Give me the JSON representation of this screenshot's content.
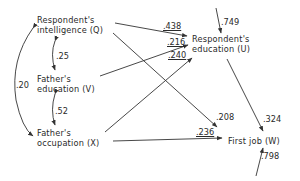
{
  "diagram": {
    "type": "path-diagram",
    "nodes": [
      {
        "id": "Q",
        "line1": "Respondent's",
        "line2": "intelligence (Q)"
      },
      {
        "id": "V",
        "line1": "Father's",
        "line2": "education (V)"
      },
      {
        "id": "X",
        "line1": "Father's",
        "line2": "occupation (X)"
      },
      {
        "id": "U",
        "line1": "Respondent's",
        "line2": "education (U)"
      },
      {
        "id": "W",
        "line1": "First job (W)"
      }
    ],
    "correlations": [
      {
        "from": "Q",
        "to": "V",
        "value": ".25"
      },
      {
        "from": "V",
        "to": "X",
        "value": ".52"
      },
      {
        "from": "Q",
        "to": "X",
        "value": ".20"
      }
    ],
    "paths": [
      {
        "from": "Q",
        "to": "U",
        "value": ".438"
      },
      {
        "from": "V",
        "to": "U",
        "value": ".216"
      },
      {
        "from": "X",
        "to": "U",
        "value": ".240"
      },
      {
        "from": "Q",
        "to": "W",
        "value": ".208"
      },
      {
        "from": "X",
        "to": "W",
        "value": ".236"
      },
      {
        "from": "U",
        "to": "W",
        "value": ".324"
      }
    ],
    "residuals": [
      {
        "to": "U",
        "value": ".749"
      },
      {
        "to": "W",
        "value": ".798"
      }
    ]
  }
}
